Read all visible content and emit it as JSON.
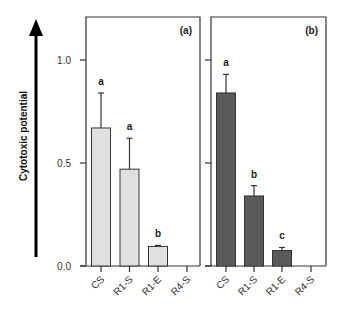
{
  "chart_data": {
    "type": "bar",
    "ylabel": "Cytotoxic potential",
    "ylabel_has_arrow": true,
    "yticks": [
      0.0,
      0.5,
      1.0
    ],
    "ytick_labels": [
      "0.0",
      "0.5",
      "1.0"
    ],
    "ylim": [
      0,
      1.25
    ],
    "grid": false,
    "categories": [
      "CS",
      "R1-S",
      "R1-E",
      "R4-S"
    ],
    "panels": [
      {
        "label": "(a)",
        "color": "#e0e0e0",
        "values": [
          0.67,
          0.47,
          0.095,
          0.0
        ],
        "error_upper": [
          0.84,
          0.62,
          0.1,
          null
        ],
        "significance": [
          "a",
          "a",
          "b",
          ""
        ]
      },
      {
        "label": "(b)",
        "color": "#5a5a5a",
        "values": [
          0.84,
          0.34,
          0.075,
          0.0
        ],
        "error_upper": [
          0.93,
          0.39,
          0.09,
          null
        ],
        "significance": [
          "a",
          "b",
          "c",
          ""
        ]
      }
    ]
  }
}
